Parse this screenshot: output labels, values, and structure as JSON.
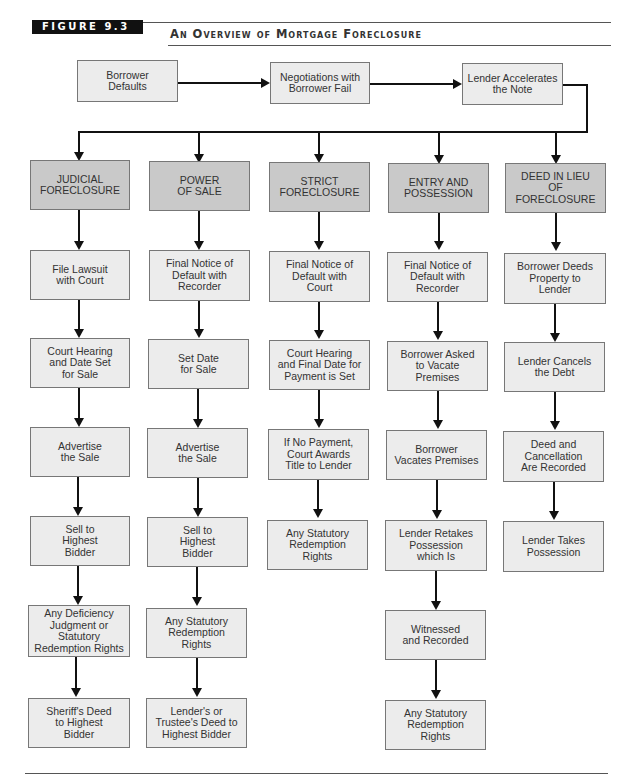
{
  "figure": {
    "label": "FIGURE 9.3",
    "title": "An Overview of Mortgage Foreclosure"
  },
  "top_flow": [
    {
      "label": "Borrower\nDefaults"
    },
    {
      "label": "Negotiations with\nBorrower Fail"
    },
    {
      "label": "Lender Accelerates\nthe Note"
    }
  ],
  "columns": [
    {
      "header": "JUDICIAL\nFORECLOSURE",
      "steps": [
        "File Lawsuit\nwith Court",
        "Court Hearing\nand Date Set\nfor Sale",
        "Advertise\nthe Sale",
        "Sell to\nHighest\nBidder",
        "Any Deficiency\nJudgment or\nStatutory\nRedemption Rights",
        "Sheriff's Deed\nto Highest\nBidder"
      ]
    },
    {
      "header": "POWER\nOF SALE",
      "steps": [
        "Final Notice of\nDefault with\nRecorder",
        "Set Date\nfor Sale",
        "Advertise\nthe Sale",
        "Sell to\nHighest\nBidder",
        "Any Statutory\nRedemption\nRights",
        "Lender's or\nTrustee's Deed to\nHighest Bidder"
      ]
    },
    {
      "header": "STRICT\nFORECLOSURE",
      "steps": [
        "Final Notice of\nDefault with\nCourt",
        "Court Hearing\nand Final Date for\nPayment is Set",
        "If No Payment,\nCourt Awards\nTitle to Lender",
        "Any Statutory\nRedemption\nRights"
      ]
    },
    {
      "header": "ENTRY AND\nPOSSESSION",
      "steps": [
        "Final Notice of\nDefault with\nRecorder",
        "Borrower Asked\nto Vacate\nPremises",
        "Borrower\nVacates Premises",
        "Lender Retakes\nPossession\nwhich Is",
        "Witnessed\nand Recorded",
        "Any Statutory\nRedemption\nRights"
      ]
    },
    {
      "header": "DEED IN LIEU\nOF FORECLOSURE",
      "steps": [
        "Borrower Deeds\nProperty to\nLender",
        "Lender Cancels\nthe Debt",
        "Deed and\nCancellation\nAre Recorded",
        "Lender Takes\nPossession"
      ]
    }
  ],
  "colors": {
    "header_fill": "#c9c9c9",
    "step_fill": "#ececec",
    "line": "#111111"
  }
}
